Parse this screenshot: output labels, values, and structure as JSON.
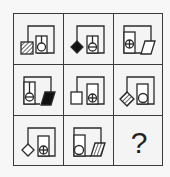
{
  "puzzle": {
    "rows": 3,
    "cols": 3,
    "missing_cell_label": "?",
    "cells": [
      {
        "row": 0,
        "col": 0,
        "outer_shape": "square",
        "outer_fill": "hatched",
        "outer_side": "left",
        "inner_symbol": "circle",
        "container_side": "right"
      },
      {
        "row": 0,
        "col": 1,
        "outer_shape": "diamond",
        "outer_fill": "black",
        "outer_side": "left",
        "inner_symbol": "circle-horizontal-line",
        "container_side": "right"
      },
      {
        "row": 0,
        "col": 2,
        "outer_shape": "parallelogram",
        "outer_fill": "white",
        "outer_side": "right",
        "inner_symbol": "circle-cross",
        "container_side": "left"
      },
      {
        "row": 1,
        "col": 0,
        "outer_shape": "parallelogram",
        "outer_fill": "black",
        "outer_side": "right",
        "inner_symbol": "circle-horizontal-line",
        "container_side": "left"
      },
      {
        "row": 1,
        "col": 1,
        "outer_shape": "square",
        "outer_fill": "white",
        "outer_side": "left",
        "inner_symbol": "circle-cross",
        "container_side": "right"
      },
      {
        "row": 1,
        "col": 2,
        "outer_shape": "diamond",
        "outer_fill": "hatched",
        "outer_side": "left",
        "inner_symbol": "circle",
        "container_side": "right"
      },
      {
        "row": 2,
        "col": 0,
        "outer_shape": "diamond",
        "outer_fill": "white",
        "outer_side": "left",
        "inner_symbol": "circle-cross",
        "container_side": "right"
      },
      {
        "row": 2,
        "col": 1,
        "outer_shape": "parallelogram",
        "outer_fill": "hatched",
        "outer_side": "right",
        "inner_symbol": "circle",
        "container_side": "left"
      },
      {
        "row": 2,
        "col": 2,
        "missing": true
      }
    ]
  },
  "colors": {
    "line": "#2a2a2a",
    "fill_black": "#111111",
    "background": "#f4f4f4"
  }
}
